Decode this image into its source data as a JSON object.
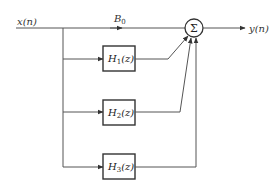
{
  "diagram": {
    "input_label": "x(n)",
    "output_label": "y(n)",
    "direct_path_label": "B0",
    "direct_path_label_base": "B",
    "direct_path_label_sub": "0",
    "summer_symbol": "Σ",
    "blocks": [
      {
        "id": "H1",
        "base": "H",
        "sub": "1",
        "arg": "(z)"
      },
      {
        "id": "H2",
        "base": "H",
        "sub": "2",
        "arg": "(z)"
      },
      {
        "id": "H3",
        "base": "H",
        "sub": "3",
        "arg": "(z)"
      }
    ],
    "colors": {
      "line": "#555555",
      "box_border": "#333333",
      "background": "#ffffff"
    }
  }
}
